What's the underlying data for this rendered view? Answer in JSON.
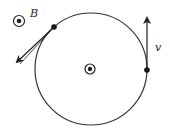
{
  "diagram": {
    "labels": {
      "field": "B",
      "velocity": "v"
    },
    "symbols": {
      "field_symbol": "dot-in-circle (out of page)",
      "center_symbol": "dot-in-circle (out of page)"
    },
    "colors": {
      "stroke": "#222222",
      "background": "#ffffff"
    }
  }
}
